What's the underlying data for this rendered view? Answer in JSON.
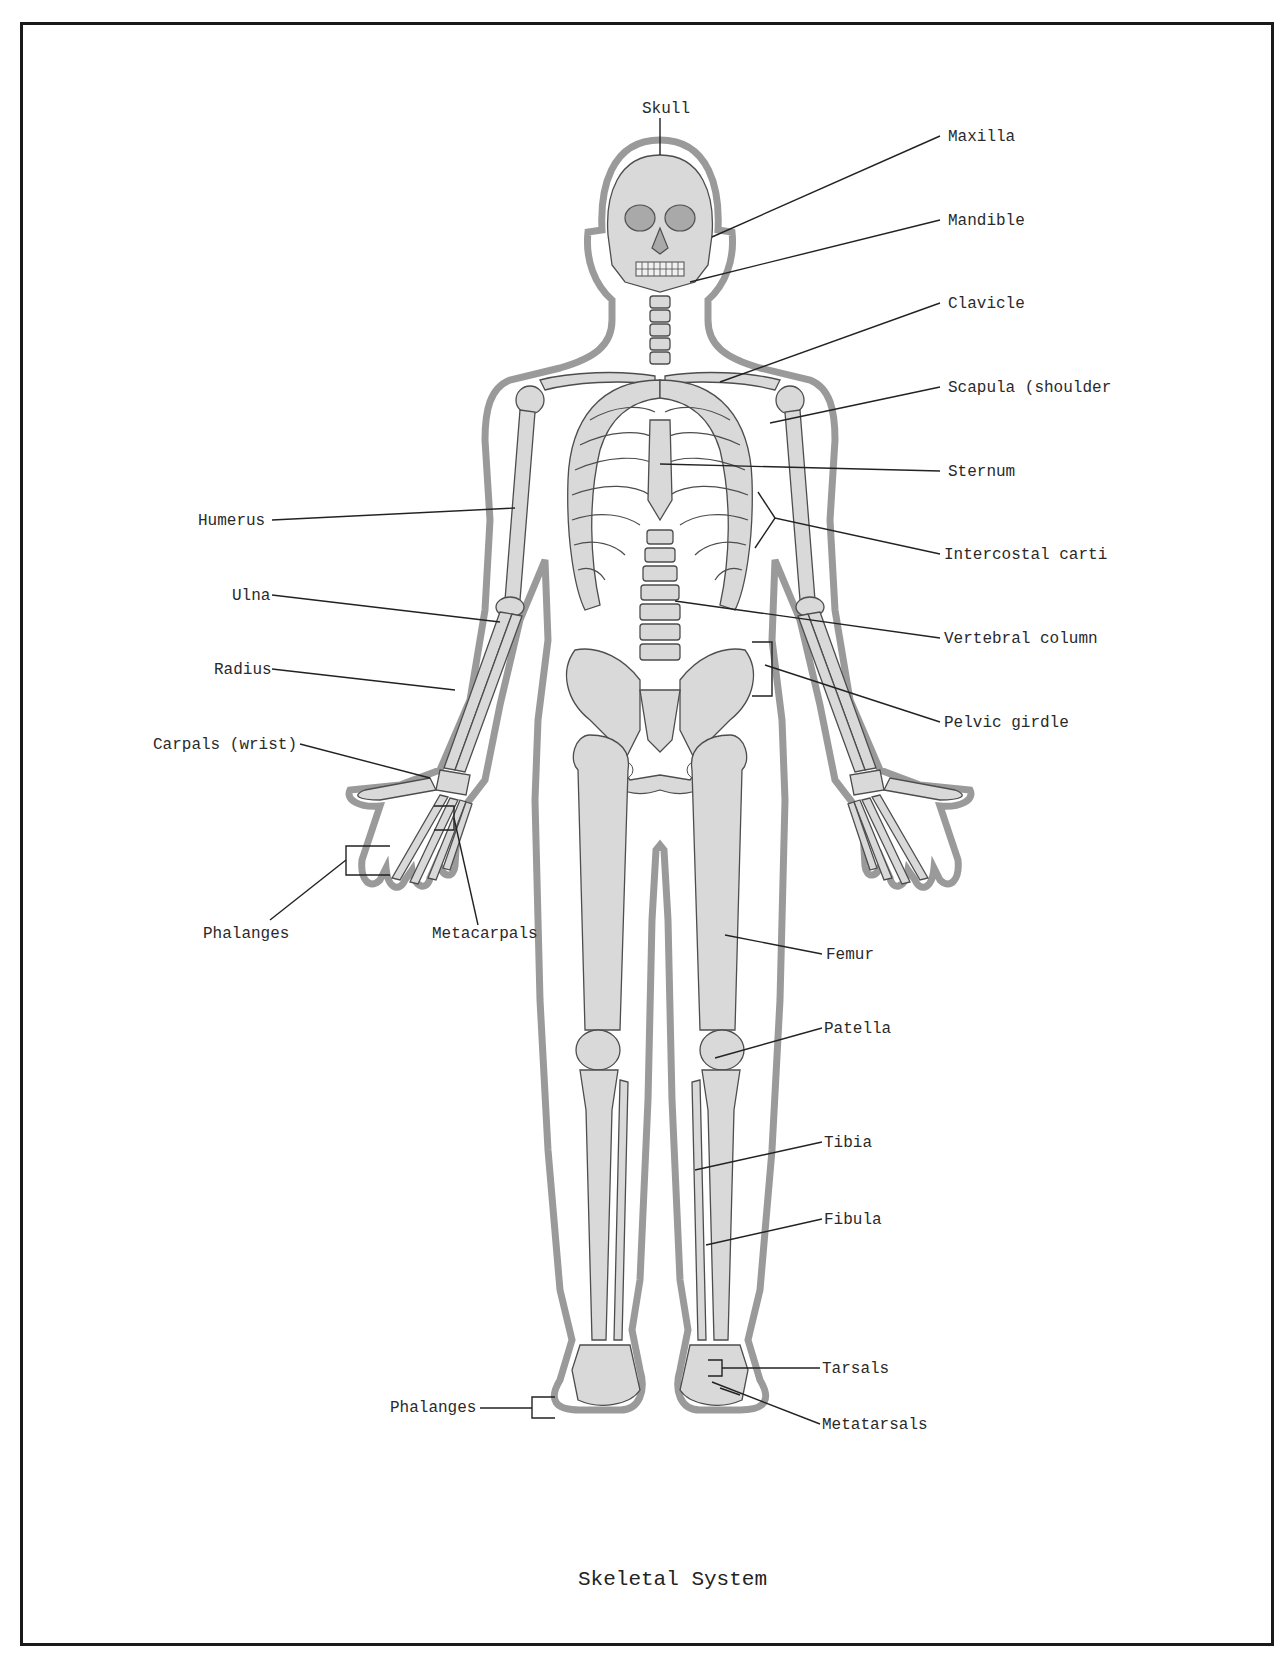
{
  "diagram": {
    "title": "Skeletal System",
    "colors": {
      "bone_fill": "#d9d9d9",
      "bone_dark": "#a9a9a9",
      "outline": "#555555",
      "skin": "#bcbcbc",
      "leader": "#222222",
      "frame": "#1a1a1a"
    },
    "labels": {
      "skull": "Skull",
      "maxilla": "Maxilla",
      "mandible": "Mandible",
      "clavicle": "Clavicle",
      "scapula": "Scapula (shoulder",
      "sternum": "Sternum",
      "intercostal": "Intercostal carti",
      "vertebral": "Vertebral column",
      "pelvic": "Pelvic girdle",
      "humerus": "Humerus",
      "ulna": "Ulna",
      "radius": "Radius",
      "carpals": "Carpals (wrist)",
      "phalanges_hand": "Phalanges",
      "metacarpals": "Metacarpals",
      "femur": "Femur",
      "patella": "Patella",
      "tibia": "Tibia",
      "fibula": "Fibula",
      "tarsals": "Tarsals",
      "phalanges_foot": "Phalanges",
      "metatarsals": "Metatarsals"
    }
  }
}
